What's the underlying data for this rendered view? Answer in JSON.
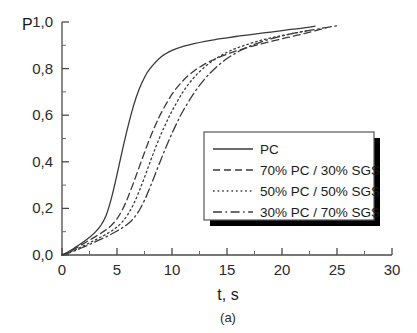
{
  "chart_data": {
    "type": "line",
    "title": "",
    "caption": "(a)",
    "xlabel": "t, s",
    "ylabel": "P",
    "xlim": [
      0,
      30
    ],
    "ylim": [
      0,
      1.0
    ],
    "grid": false,
    "legend_position": "center-right",
    "decimal_separator": ",",
    "xticks": [
      0,
      5,
      10,
      15,
      20,
      25,
      30
    ],
    "xtick_labels": [
      "0",
      "5",
      "10",
      "15",
      "20",
      "25",
      "30"
    ],
    "xtick_minor_step": 2.5,
    "yticks": [
      0,
      0.2,
      0.4,
      0.6,
      0.8,
      1.0
    ],
    "ytick_labels": [
      "0,0",
      "0,2",
      "0,4",
      "0,6",
      "0,8",
      "1,0"
    ],
    "ytick_minor_step": 0.1,
    "series": [
      {
        "name": "PC",
        "line_style": "solid",
        "color": "#3a3a3a",
        "x": [
          0,
          0.5,
          1,
          1.5,
          2,
          2.5,
          3,
          3.5,
          4,
          4.5,
          5,
          5.5,
          6,
          6.5,
          7,
          7.5,
          8,
          9,
          10,
          11,
          12,
          13,
          14,
          15,
          16,
          17,
          18,
          19,
          20,
          21,
          22,
          23
        ],
        "y": [
          0.0,
          0.012,
          0.026,
          0.042,
          0.058,
          0.076,
          0.097,
          0.125,
          0.168,
          0.245,
          0.345,
          0.452,
          0.552,
          0.64,
          0.71,
          0.762,
          0.8,
          0.85,
          0.878,
          0.895,
          0.907,
          0.917,
          0.925,
          0.932,
          0.939,
          0.945,
          0.951,
          0.957,
          0.963,
          0.969,
          0.975,
          0.982
        ]
      },
      {
        "name": "70% PC / 30% SGS",
        "line_style": "dashed",
        "color": "#3a3a3a",
        "x": [
          0,
          0.5,
          1,
          1.5,
          2,
          2.5,
          3,
          3.5,
          4,
          4.5,
          5,
          5.5,
          6,
          6.5,
          7,
          7.5,
          8,
          8.5,
          9,
          10,
          11,
          12,
          13,
          14,
          15,
          16,
          17,
          18,
          19,
          20,
          21,
          22,
          23,
          24
        ],
        "y": [
          0.0,
          0.01,
          0.022,
          0.036,
          0.05,
          0.064,
          0.078,
          0.092,
          0.108,
          0.128,
          0.155,
          0.195,
          0.248,
          0.31,
          0.375,
          0.44,
          0.502,
          0.558,
          0.608,
          0.69,
          0.748,
          0.79,
          0.82,
          0.843,
          0.862,
          0.878,
          0.892,
          0.905,
          0.917,
          0.928,
          0.939,
          0.95,
          0.962,
          0.975
        ]
      },
      {
        "name": "50% PC / 50% SGS",
        "line_style": "dotted",
        "color": "#3a3a3a",
        "x": [
          0,
          0.5,
          1,
          1.5,
          2,
          2.5,
          3,
          3.5,
          4,
          4.5,
          5,
          5.5,
          6,
          6.5,
          7,
          7.5,
          8,
          8.5,
          9,
          9.5,
          10,
          11,
          12,
          13,
          14,
          15,
          16,
          17,
          18,
          19,
          20,
          21,
          22,
          22.5
        ],
        "y": [
          0.0,
          0.008,
          0.018,
          0.029,
          0.04,
          0.052,
          0.064,
          0.076,
          0.089,
          0.103,
          0.12,
          0.143,
          0.175,
          0.218,
          0.272,
          0.333,
          0.398,
          0.46,
          0.518,
          0.57,
          0.618,
          0.7,
          0.762,
          0.808,
          0.843,
          0.87,
          0.89,
          0.906,
          0.92,
          0.932,
          0.942,
          0.951,
          0.96,
          0.964
        ]
      },
      {
        "name": "30% PC / 70% SGS",
        "line_style": "dashdot",
        "color": "#3a3a3a",
        "x": [
          0,
          0.5,
          1,
          1.5,
          2,
          2.5,
          3,
          3.5,
          4,
          4.5,
          5,
          5.5,
          6,
          6.5,
          7,
          7.5,
          8,
          8.5,
          9,
          9.5,
          10,
          10.5,
          11,
          12,
          13,
          14,
          15,
          16,
          17,
          18,
          19,
          20,
          21,
          22,
          23,
          24,
          25
        ],
        "y": [
          0.0,
          0.007,
          0.015,
          0.025,
          0.035,
          0.045,
          0.056,
          0.067,
          0.078,
          0.09,
          0.103,
          0.117,
          0.134,
          0.157,
          0.19,
          0.235,
          0.29,
          0.35,
          0.41,
          0.468,
          0.522,
          0.572,
          0.618,
          0.695,
          0.757,
          0.805,
          0.843,
          0.872,
          0.895,
          0.913,
          0.928,
          0.94,
          0.951,
          0.96,
          0.968,
          0.976,
          0.984
        ]
      }
    ]
  },
  "legend": {
    "entries": [
      {
        "label": "PC",
        "style": "solid"
      },
      {
        "label": "70% PC / 30% SGS",
        "style": "dashed"
      },
      {
        "label": "50% PC / 50% SGS",
        "style": "dotted"
      },
      {
        "label": "30% PC / 70% SGS",
        "style": "dashdot"
      }
    ]
  },
  "colors": {
    "curve": "#3a3a3a",
    "axis": "#4a4a4a",
    "text": "#1a1a1a",
    "legend_shadow": "#000000",
    "background": "#ffffff"
  }
}
